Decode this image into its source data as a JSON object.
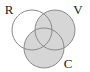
{
  "figure": {
    "type": "venn-diagram",
    "set_count": 3,
    "background_color": "#ffffff",
    "width": 90,
    "height": 72
  },
  "style": {
    "outline_color": "#8a8a8a",
    "outline_width": 1,
    "shaded_fill": "#d6d6d6",
    "unshaded_fill": "#ffffff",
    "label_color": "#1a1a1a"
  },
  "circles": [
    {
      "id": "R",
      "label": "R",
      "cx": 32,
      "cy": 30,
      "r": 20,
      "shaded": false,
      "fill": "#ffffff",
      "label_x": 9,
      "label_y": 14
    },
    {
      "id": "V",
      "label": "V",
      "cx": 55,
      "cy": 30,
      "r": 20,
      "shaded": true,
      "fill": "#d6d6d6",
      "label_x": 76,
      "label_y": 14
    },
    {
      "id": "C",
      "label": "C",
      "cx": 44,
      "cy": 48,
      "r": 20,
      "shaded": true,
      "fill": "#d6d6d6",
      "label_x": 67,
      "label_y": 68
    }
  ],
  "labels": {
    "r": "R",
    "v": "V",
    "c": "C"
  }
}
